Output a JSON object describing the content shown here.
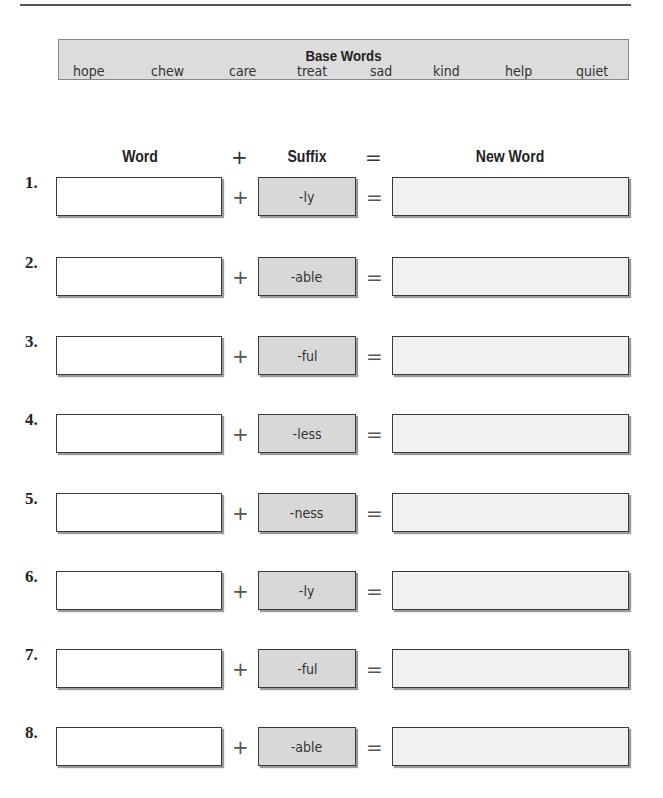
{
  "base_words": {
    "title": "Base Words",
    "words": [
      "hope",
      "chew",
      "care",
      "treat",
      "sad",
      "kind",
      "help",
      "quiet"
    ]
  },
  "columns": {
    "word": "Word",
    "plus": "+",
    "suffix": "Suffix",
    "equals": "=",
    "new_word": "New Word"
  },
  "rows": [
    {
      "number": "1.",
      "word": "",
      "suffix": "-ly",
      "new_word": ""
    },
    {
      "number": "2.",
      "word": "",
      "suffix": "-able",
      "new_word": ""
    },
    {
      "number": "3.",
      "word": "",
      "suffix": "-ful",
      "new_word": ""
    },
    {
      "number": "4.",
      "word": "",
      "suffix": "-less",
      "new_word": ""
    },
    {
      "number": "5.",
      "word": "",
      "suffix": "-ness",
      "new_word": ""
    },
    {
      "number": "6.",
      "word": "",
      "suffix": "-ly",
      "new_word": ""
    },
    {
      "number": "7.",
      "word": "",
      "suffix": "-ful",
      "new_word": ""
    },
    {
      "number": "8.",
      "word": "",
      "suffix": "-able",
      "new_word": ""
    }
  ],
  "operators": {
    "plus": "+",
    "equals": "="
  }
}
